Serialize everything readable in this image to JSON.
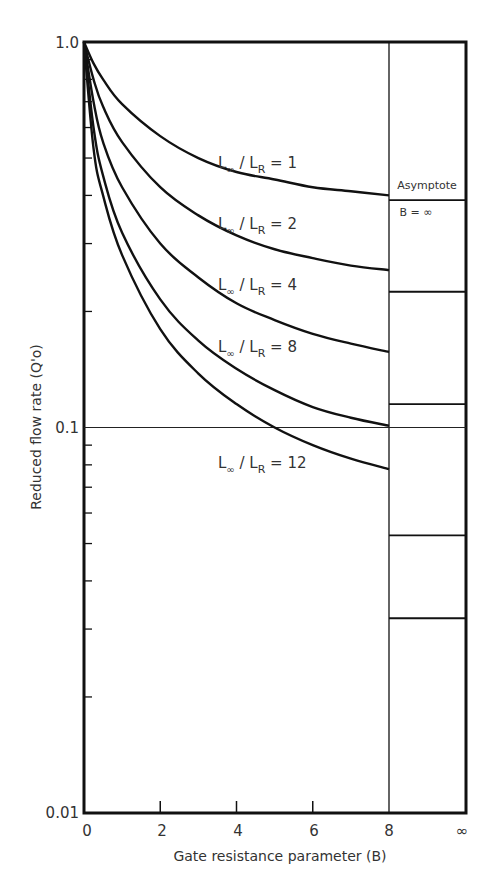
{
  "chart_data": {
    "type": "line",
    "title": "",
    "xlabel": "Gate resistance parameter (B)",
    "ylabel": "Reduced flow rate (Q'o)",
    "yscale": "log",
    "ylim": [
      0.01,
      1.0
    ],
    "xlim": [
      0,
      8
    ],
    "x_ticks": [
      "0",
      "2",
      "4",
      "6",
      "8",
      "∞"
    ],
    "y_ticks": [
      "1.0",
      "0.1",
      "0.01"
    ],
    "grid": false,
    "reference_line": {
      "y": 0.1
    },
    "series": [
      {
        "name": "L∞ / LR = 1",
        "ratio": "1",
        "x": [
          0,
          0.25,
          0.5,
          1,
          2,
          3,
          4,
          5,
          6,
          7,
          8
        ],
        "values": [
          1.0,
          0.88,
          0.8,
          0.69,
          0.57,
          0.5,
          0.46,
          0.44,
          0.42,
          0.41,
          0.4
        ]
      },
      {
        "name": "L∞ / LR = 2",
        "ratio": "2",
        "x": [
          0,
          0.25,
          0.5,
          1,
          2,
          3,
          4,
          5,
          6,
          7,
          8
        ],
        "values": [
          1.0,
          0.8,
          0.68,
          0.55,
          0.42,
          0.355,
          0.315,
          0.29,
          0.275,
          0.263,
          0.256
        ]
      },
      {
        "name": "L∞ / LR = 4",
        "ratio": "4",
        "x": [
          0,
          0.25,
          0.5,
          1,
          2,
          3,
          4,
          5,
          6,
          7,
          8
        ],
        "values": [
          1.0,
          0.7,
          0.55,
          0.42,
          0.3,
          0.245,
          0.21,
          0.19,
          0.175,
          0.165,
          0.157
        ]
      },
      {
        "name": "L∞ / LR = 8",
        "ratio": "8",
        "x": [
          0,
          0.25,
          0.5,
          1,
          2,
          3,
          4,
          5,
          6,
          7,
          8
        ],
        "values": [
          1.0,
          0.6,
          0.45,
          0.32,
          0.215,
          0.168,
          0.142,
          0.125,
          0.113,
          0.106,
          0.101
        ]
      },
      {
        "name": "L∞ / LR = 12",
        "ratio": "12",
        "x": [
          0,
          0.25,
          0.5,
          1,
          2,
          3,
          4,
          5,
          6,
          7,
          8
        ],
        "values": [
          1.0,
          0.53,
          0.4,
          0.28,
          0.18,
          0.138,
          0.115,
          0.1,
          0.09,
          0.083,
          0.078
        ]
      }
    ],
    "asymptote": {
      "label_line1": "Asymptote",
      "label_line2": "B = ∞",
      "values": [
        0.389,
        0.225,
        0.115,
        0.0525,
        0.032
      ]
    }
  },
  "labels": {
    "numerator": "L",
    "numerator_sub": "∞",
    "slash": "/",
    "denominator": "L",
    "denominator_sub": "R",
    "equals": "="
  }
}
